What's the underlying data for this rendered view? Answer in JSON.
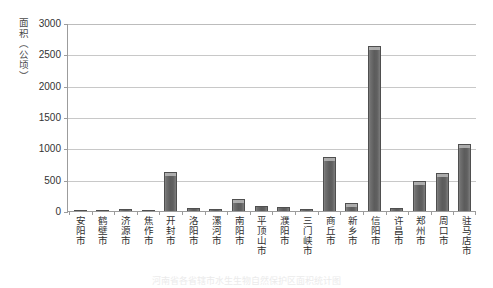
{
  "chart_data": {
    "type": "bar",
    "title": "",
    "xlabel": "",
    "ylabel": "面积（公顷）",
    "ylim": [
      0,
      3000
    ],
    "ytick_labels": [
      "3000",
      "2500",
      "2000",
      "1500",
      "1000",
      "500",
      "0"
    ],
    "ytick_values": [
      3000,
      2500,
      2000,
      1500,
      1000,
      500,
      0
    ],
    "grid": true,
    "legend": "none",
    "bar_color": "#5c5c5c",
    "categories": [
      "安阳市",
      "鹤壁市",
      "济源市",
      "焦作市",
      "开封市",
      "洛阳市",
      "漯河市",
      "南阳市",
      "平顶山市",
      "濮阳市",
      "三门峡市",
      "商丘市",
      "新乡市",
      "信阳市",
      "许昌市",
      "郑州市",
      "周口市",
      "驻马店市"
    ],
    "values": [
      5,
      5,
      25,
      8,
      620,
      50,
      25,
      195,
      75,
      70,
      40,
      855,
      130,
      2640,
      45,
      480,
      610,
      1065
    ]
  },
  "caption": {
    "text": "河南省各省辖市水生生物自然保护区面积统计图"
  }
}
